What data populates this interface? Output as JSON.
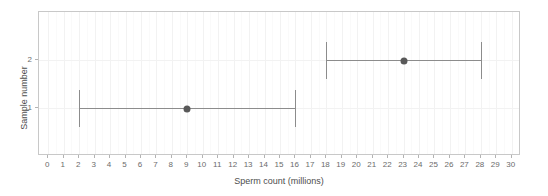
{
  "chart_data": {
    "type": "scatter",
    "title": "",
    "xlabel": "Sperm count (millions)",
    "ylabel": "Sample number",
    "xlim": [
      -0.6,
      30.6
    ],
    "xticks": [
      0,
      1,
      2,
      3,
      4,
      5,
      6,
      7,
      8,
      9,
      10,
      11,
      12,
      13,
      14,
      15,
      16,
      17,
      18,
      19,
      20,
      21,
      22,
      23,
      24,
      25,
      26,
      27,
      28,
      29,
      30
    ],
    "xticklabels": [
      "0",
      "1",
      "2",
      "3",
      "4",
      "5",
      "6",
      "7",
      "8",
      "9",
      "10",
      "11",
      "12",
      "13",
      "14",
      "15",
      "16",
      "17",
      "18",
      "19",
      "20",
      "21",
      "22",
      "23",
      "24",
      "25",
      "26",
      "27",
      "28",
      "29",
      "30"
    ],
    "categories": [
      "1",
      "2"
    ],
    "yticklabels": [
      "1",
      "2"
    ],
    "grid": true,
    "legend": "none",
    "orientation": "horizontal",
    "series": [
      {
        "name": "Sample 1",
        "category": "1",
        "value": 9,
        "lower": 2,
        "upper": 16
      },
      {
        "name": "Sample 2",
        "category": "2",
        "value": 23,
        "lower": 18,
        "upper": 28
      }
    ],
    "point_color": "#595959",
    "errorbar_color": "#8c8c8c",
    "panel_border_color": "#c8c8c8",
    "grid_color": "#f2f2f2",
    "background_color": "#ffffff"
  }
}
